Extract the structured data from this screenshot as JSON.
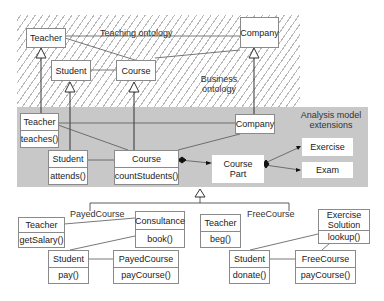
{
  "regions": {
    "teaching": {
      "label": "Teaching ontology"
    },
    "business": {
      "label_line1": "Business",
      "label_line2": "ontology"
    },
    "analysis": {
      "label_line1": "Analysis model",
      "label_line2": "extensions"
    }
  },
  "top": {
    "teacher": {
      "name": "Teacher"
    },
    "student": {
      "name": "Student"
    },
    "course": {
      "name": "Course"
    },
    "company": {
      "name": "Company"
    }
  },
  "analysis": {
    "teacher": {
      "name": "Teacher",
      "op": "teaches()"
    },
    "student": {
      "name": "Student",
      "op": "attends()"
    },
    "course": {
      "name": "Course",
      "op": "countStudents()"
    },
    "company": {
      "name": "Company"
    },
    "course_part": {
      "line1": "Course",
      "line2": "Part"
    },
    "exercise": {
      "name": "Exercise"
    },
    "exam": {
      "name": "Exam"
    }
  },
  "payed": {
    "group_label": "PayedCourse",
    "teacher": {
      "name": "Teacher",
      "op": "getSalary()"
    },
    "consultance": {
      "name": "Consultance",
      "op": "book()"
    },
    "student": {
      "name": "Student",
      "op": "pay()"
    },
    "course": {
      "name": "PayedCourse",
      "op": "payCourse()"
    }
  },
  "free": {
    "group_label": "FreeCourse",
    "teacher": {
      "name": "Teacher",
      "op": "beg()"
    },
    "exercise_solution": {
      "line1": "Exercise",
      "line2": "Solution",
      "op": "lookup()"
    },
    "student": {
      "name": "Student",
      "op": "donate()"
    },
    "course": {
      "name": "FreeCourse",
      "op": "payCourse()"
    }
  },
  "colors": {
    "hatch": "#b8b8b8",
    "band": "#c8c8c8",
    "border": "#8a8a8a",
    "line": "#333333"
  }
}
